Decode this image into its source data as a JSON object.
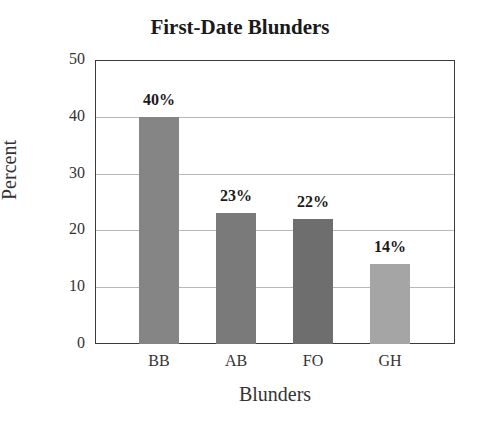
{
  "chart_data": {
    "type": "bar",
    "title": "First-Date Blunders",
    "xlabel": "Blunders",
    "ylabel": "Percent",
    "categories": [
      "BB",
      "AB",
      "FO",
      "GH"
    ],
    "values": [
      40,
      23,
      22,
      14
    ],
    "value_labels": [
      "40%",
      "23%",
      "22%",
      "14%"
    ],
    "ylim": [
      0,
      50
    ],
    "yticks": [
      "0",
      "10",
      "20",
      "30",
      "40",
      "50"
    ],
    "grid": true,
    "bar_colors": [
      "#858585",
      "#7a7a7a",
      "#6e6e6e",
      "#a5a5a5"
    ],
    "legend": null
  }
}
